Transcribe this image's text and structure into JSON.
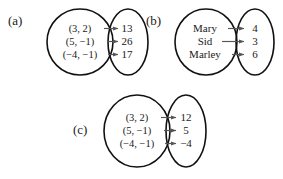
{
  "figure": {
    "panels": [
      {
        "tag": "(a)",
        "domain_items": [
          "(3, 2)",
          "(5, −1)",
          "(−4, −1)"
        ],
        "range_items": [
          "13",
          "26",
          "17"
        ],
        "mappings": [
          {
            "from": "(3, 2)",
            "to": "13"
          },
          {
            "from": "(5, −1)",
            "to": "26"
          },
          {
            "from": "(−4, −1)",
            "to": "17"
          }
        ]
      },
      {
        "tag": "(b)",
        "domain_items": [
          "Mary",
          "Sid",
          "Marley"
        ],
        "range_items": [
          "4",
          "3",
          "6"
        ],
        "mappings": [
          {
            "from": "Mary",
            "to": "4"
          },
          {
            "from": "Sid",
            "to": "3"
          },
          {
            "from": "Marley",
            "to": "6"
          }
        ]
      },
      {
        "tag": "(c)",
        "domain_items": [
          "(3, 2)",
          "(5, −1)",
          "(−4, −1)"
        ],
        "range_items": [
          "12",
          "5",
          "−4"
        ],
        "mappings": [
          {
            "from": "(3, 2)",
            "to": "12"
          },
          {
            "from": "(5, −1)",
            "to": "5"
          },
          {
            "from": "(−4, −1)",
            "to": "−4"
          }
        ]
      }
    ],
    "colors": {
      "background": "#ffffff",
      "oval_stroke": "#111111",
      "arrow_stroke": "#555555",
      "text": "#1a1a1a"
    }
  }
}
